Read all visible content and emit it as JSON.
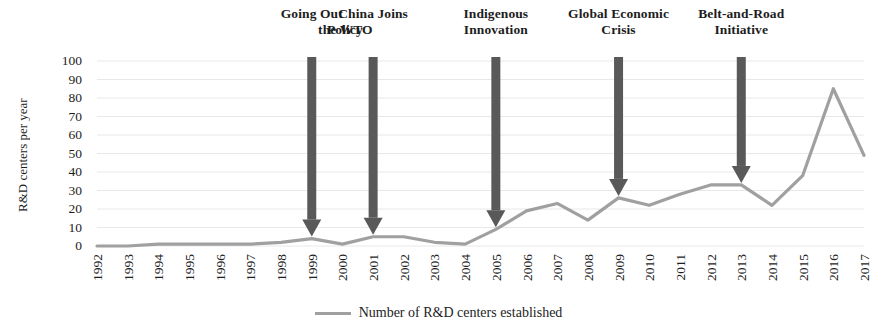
{
  "chart_data": {
    "type": "line",
    "title": "",
    "subtitle": "",
    "xlabel": "",
    "ylabel": "R&D centers per year",
    "ylim": [
      0,
      100
    ],
    "yticks": [
      0,
      10,
      20,
      30,
      40,
      50,
      60,
      70,
      80,
      90,
      100
    ],
    "grid": true,
    "legend_position": "bottom-center",
    "categories": [
      "1992",
      "1993",
      "1994",
      "1995",
      "1996",
      "1997",
      "1998",
      "1999",
      "2000",
      "2001",
      "2002",
      "2003",
      "2004",
      "2005",
      "2006",
      "2007",
      "2008",
      "2009",
      "2010",
      "2011",
      "2012",
      "2013",
      "2014",
      "2015",
      "2016",
      "2017"
    ],
    "series": [
      {
        "name": "Number of R&D centers established",
        "color": "#a0a0a0",
        "values": [
          0,
          0,
          1,
          1,
          1,
          1,
          2,
          4,
          1,
          5,
          5,
          2,
          1,
          9,
          19,
          23,
          14,
          26,
          22,
          28,
          33,
          33,
          22,
          38,
          85,
          49
        ]
      }
    ],
    "annotations": [
      {
        "label": "Going Out\nPolicy",
        "line1": "Going Out",
        "line2": "Policy",
        "x_category": "1999",
        "align": "right",
        "arrow_color": "#595959"
      },
      {
        "label": "China Joins\nthe WTO",
        "line1": "China Joins",
        "line2": "the WTO",
        "x_category": "2001",
        "align": "left",
        "arrow_color": "#595959"
      },
      {
        "label": "Indigenous\nInnovation",
        "line1": "Indigenous",
        "line2": "Innovation",
        "x_category": "2005",
        "align": "center",
        "arrow_color": "#595959"
      },
      {
        "label": "Global Economic\nCrisis",
        "line1": "Global Economic",
        "line2": "Crisis",
        "x_category": "2009",
        "align": "center",
        "arrow_color": "#595959"
      },
      {
        "label": "Belt-and-Road\nInitiative",
        "line1": "Belt-and-Road",
        "line2": "Initiative",
        "x_category": "2013",
        "align": "center",
        "arrow_color": "#595959"
      }
    ]
  },
  "legend": {
    "entries": [
      {
        "label": "Number of R&D centers established",
        "color": "#a0a0a0"
      }
    ]
  },
  "colors": {
    "line": "#a0a0a0",
    "arrow": "#595959",
    "grid": "#e8e8e8",
    "text": "#1d1d1d",
    "background": "#ffffff"
  }
}
